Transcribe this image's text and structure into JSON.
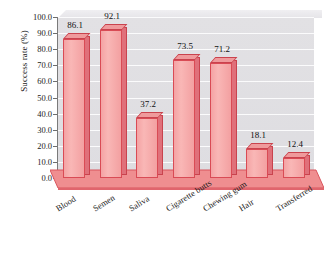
{
  "chart_data": {
    "type": "bar",
    "title": "",
    "xlabel": "",
    "ylabel": "Success rate (%)",
    "categories": [
      "Blood",
      "Semen",
      "Saliva",
      "Cigarette butts",
      "Chewing gum",
      "Hair",
      "Transferred"
    ],
    "values": [
      86.1,
      92.1,
      37.2,
      73.5,
      71.2,
      18.1,
      12.4
    ],
    "value_labels": [
      "86.1",
      "92.1",
      "37.2",
      "73.5",
      "71.2",
      "18.1",
      "12.4"
    ],
    "ylim": [
      0.0,
      100.0
    ],
    "ytick_labels": [
      "100.0",
      "90.0",
      "80.0",
      "70.0",
      "60.0",
      "50.0",
      "40.0",
      "30.0",
      "20.0",
      "10.0",
      "0.0"
    ],
    "ytick_values": [
      100.0,
      90.0,
      80.0,
      70.0,
      60.0,
      50.0,
      40.0,
      30.0,
      20.0,
      10.0,
      0.0
    ],
    "grid": true,
    "legend": null,
    "style": "3d-column",
    "colors": {
      "bar_face": "#f6aeae",
      "bar_edge": "#d94b55",
      "bar_side": "#e0707a",
      "plot_background": "#e0dfe3",
      "gridline": "#fbfbfc",
      "floor": "#ef8e90",
      "axis": "#7a7a7a",
      "text": "#1c1c1c"
    }
  }
}
